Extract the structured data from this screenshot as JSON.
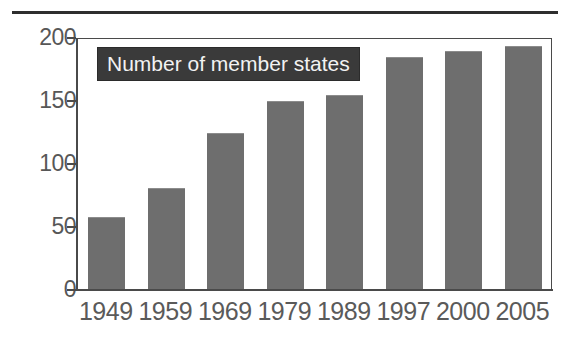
{
  "figure": {
    "top_rule": true,
    "background_color": "#ffffff"
  },
  "legend": {
    "label": "Number of member states",
    "box_color": "#3a3a3a",
    "text_color": "#f2f2f2"
  },
  "axes": {
    "y_ticks": [
      "0",
      "50",
      "100",
      "150",
      "200"
    ],
    "x_ticks": [
      "1949",
      "1959",
      "1969",
      "1979",
      "1989",
      "1997",
      "2000",
      "2005"
    ],
    "frame_color": "#4a4a4a",
    "label_color": "#5a5a5a"
  },
  "chart_data": {
    "type": "bar",
    "title": "Number of member states",
    "xlabel": "",
    "ylabel": "",
    "categories": [
      "1949",
      "1959",
      "1969",
      "1979",
      "1989",
      "1997",
      "2000",
      "2005"
    ],
    "values": [
      57,
      80,
      124,
      149,
      154,
      184,
      189,
      193
    ],
    "ylim": [
      0,
      200
    ],
    "yticks": [
      0,
      50,
      100,
      150,
      200
    ],
    "grid": false,
    "legend": [
      "Number of member states"
    ],
    "legend_position": "inside-top-left",
    "bar_color": "#6e6e6e",
    "orientation": "vertical"
  }
}
